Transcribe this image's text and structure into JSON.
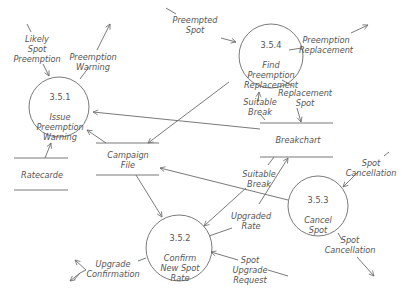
{
  "diagram": {
    "type": "data-flow-diagram",
    "colors": {
      "stroke": "#6a6a6a",
      "text": "#555555",
      "background": "#ffffff"
    },
    "processes": [
      {
        "id": "3.5.1",
        "name": "Issue\nPreemption\nWarning"
      },
      {
        "id": "3.5.2",
        "name": "Confirm\nNew Spot\nRate"
      },
      {
        "id": "3.5.3",
        "name": "Cancel\nSpot"
      },
      {
        "id": "3.5.4",
        "name": "Find\nPreemption\nReplacement"
      }
    ],
    "data_stores": [
      {
        "name": "Ratecarde"
      },
      {
        "name": "Campaign\nFile"
      },
      {
        "name": "Breakchart"
      }
    ],
    "flows": [
      {
        "label": "Likely\nSpot\nPreemption"
      },
      {
        "label": "Preemption\nWarning"
      },
      {
        "label": "Preempted\nSpot"
      },
      {
        "label": "Preemption\nReplacement"
      },
      {
        "label": "Suitable\nBreak"
      },
      {
        "label": "Replacement\nSpot"
      },
      {
        "label": "Suitable\nBreak"
      },
      {
        "label": "Upgraded\nRate"
      },
      {
        "label": "Spot\nCancellation"
      },
      {
        "label": "Spot\nCancellation"
      },
      {
        "label": "Upgrade\nConfirmation"
      },
      {
        "label": "Spot\nUpgrade\nRequest"
      }
    ]
  }
}
